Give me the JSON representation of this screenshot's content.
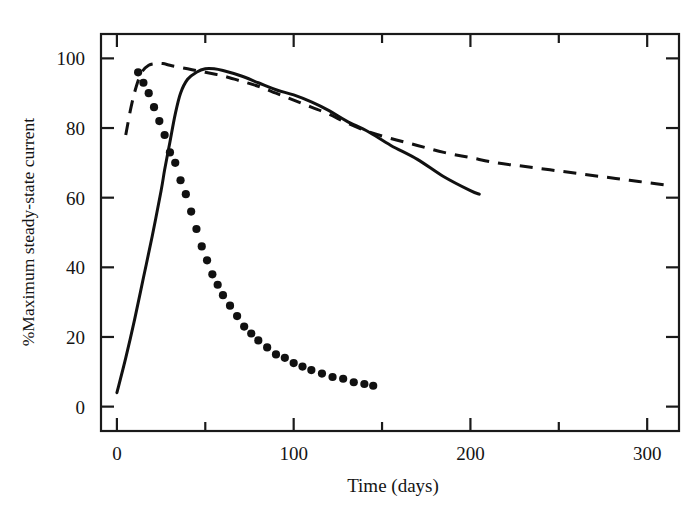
{
  "figure": {
    "background_color": "#ffffff",
    "ink_color": "#111111"
  },
  "chart_data": {
    "type": "line",
    "title": "",
    "subtitle": "",
    "xlabel": "Time (days)",
    "ylabel": "%Maximum steady-state current",
    "xlim": [
      -9,
      318
    ],
    "ylim": [
      -7,
      107
    ],
    "xticks": [
      0,
      50,
      100,
      150,
      200,
      250,
      300
    ],
    "xtick_labels": [
      "0",
      "",
      "100",
      "",
      "200",
      "",
      "300"
    ],
    "yticks": [
      0,
      20,
      40,
      60,
      80,
      100
    ],
    "ytick_labels": [
      "0",
      "20",
      "40",
      "60",
      "80",
      "100"
    ],
    "grid": false,
    "legend": "none",
    "frame": "box",
    "ticks_all_sides": true,
    "series": [
      {
        "name": "solid-curve",
        "style": "solid",
        "x": [
          0,
          5,
          10,
          15,
          20,
          25,
          27,
          30,
          33,
          36,
          40,
          45,
          50,
          55,
          60,
          70,
          80,
          90,
          100,
          110,
          120,
          130,
          142,
          155,
          170,
          185,
          200,
          205
        ],
        "values": [
          4,
          14,
          25,
          37,
          49,
          62,
          68,
          76,
          84,
          90,
          94,
          96,
          97,
          97,
          96.5,
          95,
          93,
          91,
          89.5,
          87.5,
          85,
          82,
          79,
          75,
          71,
          66,
          62,
          61
        ]
      },
      {
        "name": "dashed-curve",
        "style": "dashed",
        "x": [
          5,
          8,
          11,
          14,
          18,
          22,
          26,
          30,
          35,
          40,
          45,
          50,
          55,
          60,
          70,
          80,
          90,
          100,
          110,
          120,
          130,
          142,
          155,
          170,
          185,
          200,
          215,
          230,
          245,
          260,
          275,
          290,
          305,
          313
        ],
        "values": [
          78,
          86,
          92,
          96,
          98,
          98.5,
          98.5,
          98,
          97.5,
          97,
          96.5,
          96,
          95.5,
          95,
          93.5,
          92,
          90,
          88,
          86,
          84,
          81.5,
          79,
          77,
          75,
          73,
          71.5,
          70,
          69,
          68,
          67,
          66,
          65,
          64,
          63.5
        ]
      },
      {
        "name": "dotted-curve",
        "style": "dotted",
        "x": [
          12,
          15,
          18,
          21,
          24,
          27,
          30,
          33,
          36,
          39,
          42,
          45,
          48,
          51,
          54,
          57,
          60,
          64,
          68,
          72,
          76,
          80,
          85,
          90,
          95,
          100,
          105,
          110,
          116,
          122,
          128,
          134,
          140,
          145
        ],
        "values": [
          96,
          93,
          90,
          86,
          82,
          78,
          73,
          70,
          65,
          61,
          56,
          51,
          46,
          42,
          38,
          35,
          32,
          29,
          26,
          23,
          21,
          19,
          17,
          15,
          14,
          12.5,
          11.5,
          10.5,
          9.5,
          8.5,
          8,
          7,
          6.5,
          6
        ]
      }
    ]
  },
  "axes": {
    "x_title": "Time (days)",
    "y_title": "%Maximum steady-state current"
  }
}
